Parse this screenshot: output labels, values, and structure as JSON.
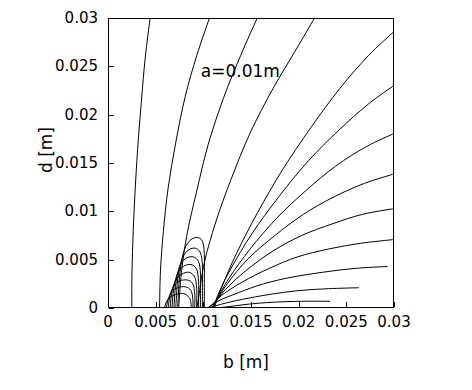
{
  "chart_data": {
    "type": "line",
    "title": "",
    "xlabel": "b [m]",
    "ylabel": "d [m]",
    "xlim": [
      0,
      0.03
    ],
    "ylim": [
      0,
      0.03
    ],
    "xticks": [
      "0",
      "0.005",
      "0.01",
      "0.015",
      "0.02",
      "0.025",
      "0.03"
    ],
    "xtick_values": [
      0,
      0.005,
      0.01,
      0.015,
      0.02,
      0.025,
      0.03
    ],
    "yticks": [
      "0",
      "0.005",
      "0.01",
      "0.015",
      "0.02",
      "0.025",
      "0.03"
    ],
    "ytick_values": [
      0,
      0.005,
      0.01,
      0.015,
      0.02,
      0.025,
      0.03
    ],
    "grid": false,
    "legend": "none",
    "annotations": [
      {
        "text": "a=0.01m",
        "x": 0.0155,
        "y": 0.0245
      }
    ],
    "contours": [
      {
        "name": "contour-1",
        "points": [
          [
            0.0043,
            0.03
          ],
          [
            0.0038,
            0.026
          ],
          [
            0.0034,
            0.0215
          ],
          [
            0.003,
            0.0165
          ],
          [
            0.0027,
            0.0115
          ],
          [
            0.0025,
            0.007
          ],
          [
            0.0024,
            0.003
          ],
          [
            0.0024,
            0.0
          ]
        ]
      },
      {
        "name": "contour-2",
        "points": [
          [
            0.0105,
            0.03
          ],
          [
            0.0092,
            0.0262
          ],
          [
            0.008,
            0.022
          ],
          [
            0.007,
            0.0172
          ],
          [
            0.0062,
            0.0125
          ],
          [
            0.0057,
            0.008
          ],
          [
            0.0054,
            0.004
          ],
          [
            0.0053,
            0.0
          ]
        ]
      },
      {
        "name": "contour-3",
        "points": [
          [
            0.0155,
            0.03
          ],
          [
            0.0138,
            0.0262
          ],
          [
            0.012,
            0.0218
          ],
          [
            0.0104,
            0.017
          ],
          [
            0.0092,
            0.0122
          ],
          [
            0.0082,
            0.0078
          ],
          [
            0.0076,
            0.0038
          ],
          [
            0.0073,
            0.0
          ]
        ]
      },
      {
        "name": "contour-4",
        "points": [
          [
            0.0215,
            0.03
          ],
          [
            0.0196,
            0.0268
          ],
          [
            0.0172,
            0.0228
          ],
          [
            0.0148,
            0.0182
          ],
          [
            0.0128,
            0.0134
          ],
          [
            0.0112,
            0.009
          ],
          [
            0.01,
            0.0048
          ],
          [
            0.0094,
            0.0012
          ],
          [
            0.0092,
            0.0
          ]
        ]
      },
      {
        "name": "contour-5",
        "points": [
          [
            0.03,
            0.0288
          ],
          [
            0.0272,
            0.0262
          ],
          [
            0.0242,
            0.0228
          ],
          [
            0.0212,
            0.0188
          ],
          [
            0.0182,
            0.0144
          ],
          [
            0.0156,
            0.01
          ],
          [
            0.0134,
            0.0058
          ],
          [
            0.0118,
            0.0022
          ],
          [
            0.011,
            0.0
          ]
        ]
      },
      {
        "name": "contour-6",
        "points": [
          [
            0.03,
            0.0232
          ],
          [
            0.0272,
            0.0212
          ],
          [
            0.024,
            0.0184
          ],
          [
            0.0208,
            0.0152
          ],
          [
            0.0178,
            0.0116
          ],
          [
            0.015,
            0.0078
          ],
          [
            0.0128,
            0.0042
          ],
          [
            0.0114,
            0.0014
          ],
          [
            0.011,
            0.0
          ]
        ]
      },
      {
        "name": "contour-7",
        "points": [
          [
            0.03,
            0.0182
          ],
          [
            0.027,
            0.0168
          ],
          [
            0.0238,
            0.0148
          ],
          [
            0.0206,
            0.0122
          ],
          [
            0.0176,
            0.0094
          ],
          [
            0.0148,
            0.0062
          ],
          [
            0.0126,
            0.0032
          ],
          [
            0.0112,
            0.0008
          ],
          [
            0.0109,
            0.0
          ]
        ]
      },
      {
        "name": "contour-8",
        "points": [
          [
            0.03,
            0.014
          ],
          [
            0.0268,
            0.013
          ],
          [
            0.0236,
            0.0116
          ],
          [
            0.0204,
            0.0098
          ],
          [
            0.0174,
            0.0076
          ],
          [
            0.0146,
            0.0052
          ],
          [
            0.0124,
            0.0026
          ],
          [
            0.011,
            0.0004
          ],
          [
            0.0108,
            0.0
          ]
        ]
      },
      {
        "name": "contour-9",
        "points": [
          [
            0.03,
            0.0104
          ],
          [
            0.0266,
            0.0098
          ],
          [
            0.0234,
            0.0088
          ],
          [
            0.0202,
            0.0076
          ],
          [
            0.0172,
            0.006
          ],
          [
            0.0144,
            0.004
          ],
          [
            0.0122,
            0.002
          ],
          [
            0.0108,
            0.0002
          ],
          [
            0.0106,
            0.0
          ]
        ]
      },
      {
        "name": "contour-10",
        "points": [
          [
            0.03,
            0.0072
          ],
          [
            0.0264,
            0.0068
          ],
          [
            0.023,
            0.0062
          ],
          [
            0.0198,
            0.0054
          ],
          [
            0.0168,
            0.0042
          ],
          [
            0.014,
            0.0028
          ],
          [
            0.0118,
            0.0014
          ],
          [
            0.0104,
            0.0
          ]
        ]
      },
      {
        "name": "contour-11",
        "points": [
          [
            0.0292,
            0.0044
          ],
          [
            0.0258,
            0.0042
          ],
          [
            0.0224,
            0.0038
          ],
          [
            0.0192,
            0.0033
          ],
          [
            0.0162,
            0.0026
          ],
          [
            0.0136,
            0.0017
          ],
          [
            0.0114,
            0.0008
          ],
          [
            0.0102,
            0.0
          ]
        ]
      },
      {
        "name": "contour-12",
        "points": [
          [
            0.0262,
            0.0022
          ],
          [
            0.023,
            0.0021
          ],
          [
            0.0198,
            0.0019
          ],
          [
            0.0168,
            0.0015
          ],
          [
            0.014,
            0.001
          ],
          [
            0.0118,
            0.0005
          ],
          [
            0.0102,
            0.0
          ]
        ]
      },
      {
        "name": "contour-13",
        "points": [
          [
            0.0232,
            0.0008
          ],
          [
            0.0202,
            0.0008
          ],
          [
            0.0172,
            0.0007
          ],
          [
            0.0146,
            0.0005
          ],
          [
            0.0122,
            0.0002
          ],
          [
            0.01,
            0.0
          ]
        ]
      },
      {
        "name": "contour-14",
        "points": [
          [
            0.0072,
            0.0
          ],
          [
            0.0074,
            0.0034
          ],
          [
            0.0078,
            0.0058
          ],
          [
            0.0084,
            0.007
          ],
          [
            0.0092,
            0.0074
          ],
          [
            0.0098,
            0.007
          ],
          [
            0.01,
            0.0056
          ],
          [
            0.01,
            0.003
          ],
          [
            0.01,
            0.0
          ]
        ]
      },
      {
        "name": "contour-15",
        "points": [
          [
            0.007,
            0.0
          ],
          [
            0.0072,
            0.003
          ],
          [
            0.0076,
            0.005
          ],
          [
            0.0082,
            0.006
          ],
          [
            0.009,
            0.0063
          ],
          [
            0.0096,
            0.0058
          ],
          [
            0.0098,
            0.0044
          ],
          [
            0.0098,
            0.0022
          ],
          [
            0.0098,
            0.0
          ]
        ]
      },
      {
        "name": "contour-16",
        "points": [
          [
            0.0068,
            0.0
          ],
          [
            0.007,
            0.0026
          ],
          [
            0.0074,
            0.0044
          ],
          [
            0.008,
            0.0052
          ],
          [
            0.0088,
            0.0054
          ],
          [
            0.0094,
            0.0049
          ],
          [
            0.0096,
            0.0036
          ],
          [
            0.0096,
            0.0016
          ],
          [
            0.0096,
            0.0
          ]
        ]
      },
      {
        "name": "contour-17",
        "points": [
          [
            0.0066,
            0.0
          ],
          [
            0.0068,
            0.0022
          ],
          [
            0.0072,
            0.0037
          ],
          [
            0.0078,
            0.0044
          ],
          [
            0.0086,
            0.0046
          ],
          [
            0.0092,
            0.0041
          ],
          [
            0.0094,
            0.0028
          ],
          [
            0.0094,
            0.0012
          ],
          [
            0.0094,
            0.0
          ]
        ]
      },
      {
        "name": "contour-18",
        "points": [
          [
            0.0064,
            0.0
          ],
          [
            0.0066,
            0.0018
          ],
          [
            0.007,
            0.003
          ],
          [
            0.0076,
            0.0036
          ],
          [
            0.0084,
            0.0038
          ],
          [
            0.009,
            0.0033
          ],
          [
            0.0092,
            0.0021
          ],
          [
            0.0092,
            0.0008
          ],
          [
            0.0092,
            0.0
          ]
        ]
      },
      {
        "name": "contour-19",
        "points": [
          [
            0.0062,
            0.0
          ],
          [
            0.0064,
            0.0014
          ],
          [
            0.0068,
            0.0024
          ],
          [
            0.0074,
            0.0029
          ],
          [
            0.0082,
            0.003
          ],
          [
            0.0088,
            0.0026
          ],
          [
            0.009,
            0.0015
          ],
          [
            0.009,
            0.0005
          ],
          [
            0.009,
            0.0
          ]
        ]
      },
      {
        "name": "contour-20",
        "points": [
          [
            0.006,
            0.0
          ],
          [
            0.0062,
            0.001
          ],
          [
            0.0066,
            0.0018
          ],
          [
            0.0072,
            0.0022
          ],
          [
            0.008,
            0.0023
          ],
          [
            0.0086,
            0.0019
          ],
          [
            0.0088,
            0.001
          ],
          [
            0.0088,
            0.0002
          ],
          [
            0.0088,
            0.0
          ]
        ]
      },
      {
        "name": "contour-21",
        "points": [
          [
            0.0058,
            0.0
          ],
          [
            0.006,
            0.0007
          ],
          [
            0.0064,
            0.0012
          ],
          [
            0.007,
            0.0015
          ],
          [
            0.0078,
            0.0016
          ],
          [
            0.0084,
            0.0012
          ],
          [
            0.0086,
            0.0006
          ],
          [
            0.0086,
            0.0
          ]
        ]
      }
    ]
  }
}
